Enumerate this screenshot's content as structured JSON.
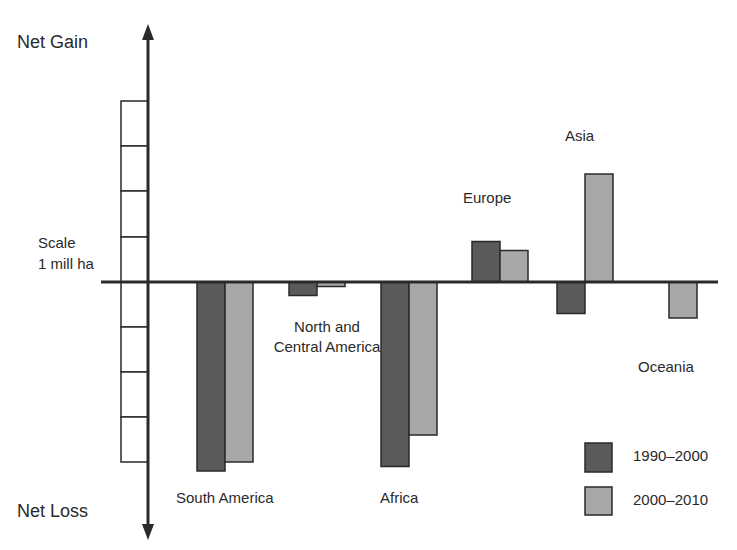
{
  "chart_data": {
    "type": "bar",
    "title": "",
    "xlabel": "",
    "ylabel": "",
    "axis_labels": {
      "top": "Net Gain",
      "bottom": "Net Loss"
    },
    "scale_label": [
      "Scale",
      "1 mill ha"
    ],
    "unit": "million ha per year",
    "categories": [
      "South America",
      "North and Central America",
      "Africa",
      "Europe",
      "Asia",
      "Oceania"
    ],
    "series": [
      {
        "name": "1990–2000",
        "color": "#5a5a5a",
        "values": [
          -4.2,
          -0.3,
          -4.1,
          0.9,
          -0.7,
          null
        ]
      },
      {
        "name": "2000–2010",
        "color": "#a8a8a8",
        "values": [
          -4.0,
          -0.1,
          -3.4,
          0.7,
          2.4,
          -0.8
        ]
      }
    ],
    "ylim": [
      -4.5,
      4.5
    ],
    "grid": false,
    "legend_position": "bottom-right"
  },
  "labels": {
    "net_gain": "Net Gain",
    "net_loss": "Net Loss",
    "scale_line1": "Scale",
    "scale_line2": "1 mill ha",
    "south_america": "South America",
    "north_central_line1": "North and",
    "north_central_line2": "Central America",
    "africa": "Africa",
    "europe": "Europe",
    "asia": "Asia",
    "oceania": "Oceania"
  },
  "legend": {
    "items": [
      {
        "label": "1990–2000",
        "color": "#5a5a5a"
      },
      {
        "label": "2000–2010",
        "color": "#a8a8a8"
      }
    ]
  }
}
